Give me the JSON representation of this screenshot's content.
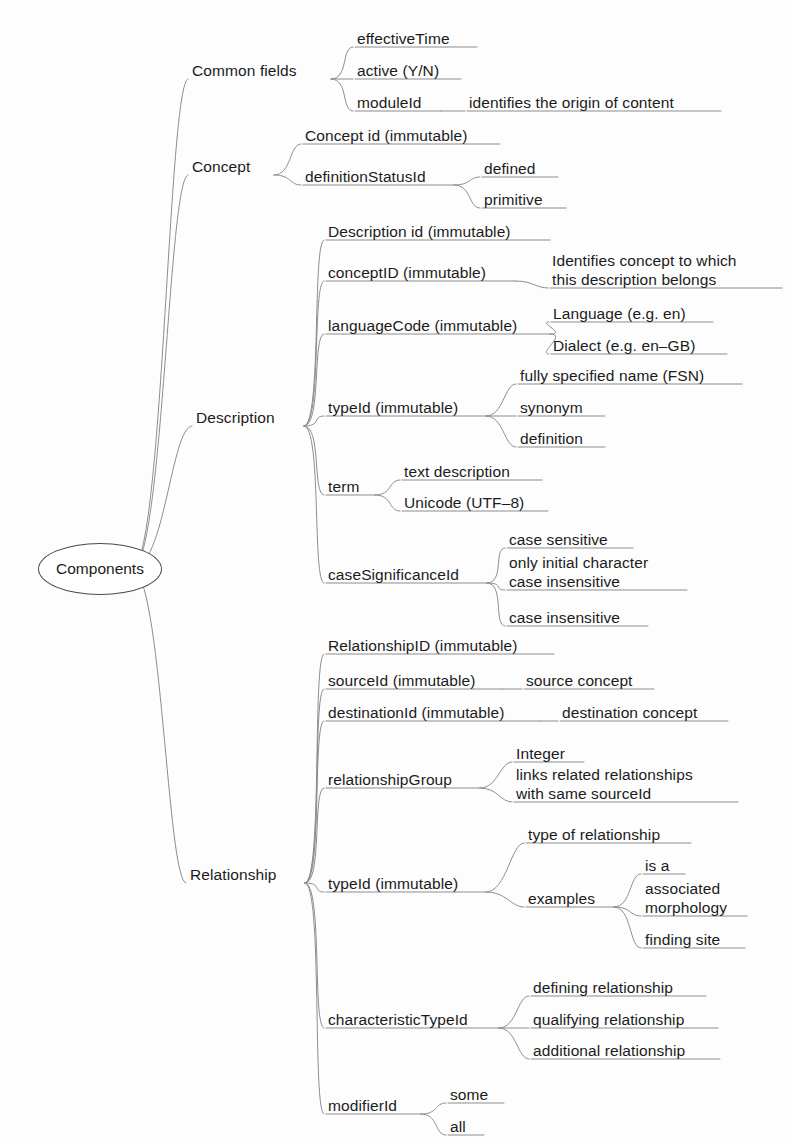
{
  "diagram": {
    "title": "Components",
    "type": "mind-map",
    "root": {
      "label": "Components",
      "x": 38,
      "y": 543,
      "w": 124,
      "h": 52
    },
    "line_color": "#8d8d8d",
    "text_color": "#1b1b1b",
    "background": "#fdfdfd",
    "nodes": [
      {
        "id": "common-fields",
        "label": "Common fields",
        "level": 1,
        "x": 192,
        "y": 61,
        "w": 131,
        "underline": false
      },
      {
        "id": "effective-time",
        "label": "effectiveTime",
        "level": 2,
        "x": 357,
        "y": 29,
        "w": 112,
        "underline": true
      },
      {
        "id": "active-yn",
        "label": "active (Y/N)",
        "level": 2,
        "x": 357,
        "y": 61,
        "w": 96,
        "underline": true
      },
      {
        "id": "module-id",
        "label": "moduleId",
        "level": 2,
        "x": 357,
        "y": 93,
        "w": 76,
        "underline": true
      },
      {
        "id": "identifies-origin",
        "label": "identifies the origin of content",
        "level": 3,
        "x": 469,
        "y": 93,
        "w": 244,
        "underline": true
      },
      {
        "id": "concept",
        "label": "Concept",
        "level": 1,
        "x": 192,
        "y": 157,
        "w": 74,
        "underline": false
      },
      {
        "id": "concept-id",
        "label": "Concept id (immutable)",
        "level": 2,
        "x": 305,
        "y": 126,
        "w": 187,
        "underline": true
      },
      {
        "id": "definition-status-id",
        "label": "definitionStatusId",
        "level": 2,
        "x": 305,
        "y": 167,
        "w": 141,
        "underline": true
      },
      {
        "id": "defined",
        "label": "defined",
        "level": 3,
        "x": 484,
        "y": 159,
        "w": 66,
        "underline": true
      },
      {
        "id": "primitive",
        "label": "primitive",
        "level": 3,
        "x": 484,
        "y": 190,
        "w": 74,
        "underline": true
      },
      {
        "id": "description",
        "label": "Description",
        "level": 1,
        "x": 196,
        "y": 408,
        "w": 100,
        "underline": false
      },
      {
        "id": "description-id",
        "label": "Description id (immutable)",
        "level": 2,
        "x": 328,
        "y": 222,
        "w": 214,
        "underline": true
      },
      {
        "id": "concept-id-2",
        "label": "conceptID (immutable)",
        "level": 2,
        "x": 328,
        "y": 263,
        "w": 179,
        "underline": true
      },
      {
        "id": "identifies-concept",
        "label": "Identifies concept to which\nthis description belongs",
        "level": 3,
        "x": 552,
        "y": 251,
        "w": 222,
        "underline": true
      },
      {
        "id": "language-code",
        "label": "languageCode (immutable)",
        "level": 2,
        "x": 328,
        "y": 316,
        "w": 214,
        "underline": true
      },
      {
        "id": "language-en",
        "label": "Language (e.g. en)",
        "level": 3,
        "x": 553,
        "y": 304,
        "w": 152,
        "underline": true
      },
      {
        "id": "dialect-engb",
        "label": "Dialect (e.g. en–GB)",
        "level": 3,
        "x": 553,
        "y": 336,
        "w": 166,
        "underline": true
      },
      {
        "id": "type-id",
        "label": "typeId (immutable)",
        "level": 2,
        "x": 328,
        "y": 398,
        "w": 150,
        "underline": true
      },
      {
        "id": "fsn",
        "label": "fully specified name (FSN)",
        "level": 3,
        "x": 520,
        "y": 366,
        "w": 214,
        "underline": true
      },
      {
        "id": "synonym",
        "label": "synonym",
        "level": 3,
        "x": 520,
        "y": 398,
        "w": 77,
        "underline": true
      },
      {
        "id": "definition",
        "label": "definition",
        "level": 3,
        "x": 520,
        "y": 429,
        "w": 77,
        "underline": true
      },
      {
        "id": "term",
        "label": "term",
        "level": 2,
        "x": 328,
        "y": 477,
        "w": 39,
        "underline": true
      },
      {
        "id": "text-description",
        "label": "text description",
        "level": 3,
        "x": 404,
        "y": 462,
        "w": 130,
        "underline": true
      },
      {
        "id": "unicode-utf8",
        "label": "Unicode (UTF–8)",
        "level": 3,
        "x": 404,
        "y": 493,
        "w": 136,
        "underline": true
      },
      {
        "id": "case-significance-id",
        "label": "caseSignificanceId",
        "level": 2,
        "x": 328,
        "y": 565,
        "w": 151,
        "underline": true
      },
      {
        "id": "case-sensitive",
        "label": "case sensitive",
        "level": 3,
        "x": 509,
        "y": 530,
        "w": 116,
        "underline": true
      },
      {
        "id": "only-initial-character",
        "label": "only initial character\ncase insensitive",
        "level": 3,
        "x": 509,
        "y": 553,
        "w": 170,
        "underline": true
      },
      {
        "id": "case-insensitive",
        "label": "case insensitive",
        "level": 3,
        "x": 509,
        "y": 608,
        "w": 131,
        "underline": true
      },
      {
        "id": "relationship",
        "label": "Relationship",
        "level": 1,
        "x": 190,
        "y": 865,
        "w": 107,
        "underline": false
      },
      {
        "id": "relationship-id",
        "label": "RelationshipID (immutable)",
        "level": 2,
        "x": 328,
        "y": 636,
        "w": 218,
        "underline": true
      },
      {
        "id": "source-id",
        "label": "sourceId (immutable)",
        "level": 2,
        "x": 328,
        "y": 671,
        "w": 166,
        "underline": true
      },
      {
        "id": "source-concept",
        "label": "source concept",
        "level": 3,
        "x": 526,
        "y": 671,
        "w": 120,
        "underline": true
      },
      {
        "id": "destination-id",
        "label": "destinationId (immutable)",
        "level": 2,
        "x": 328,
        "y": 703,
        "w": 203,
        "underline": true
      },
      {
        "id": "destination-concept",
        "label": "destination concept",
        "level": 3,
        "x": 562,
        "y": 703,
        "w": 158,
        "underline": true
      },
      {
        "id": "relationship-group",
        "label": "relationshipGroup",
        "level": 2,
        "x": 328,
        "y": 770,
        "w": 144,
        "underline": true
      },
      {
        "id": "integer",
        "label": "Integer",
        "level": 3,
        "x": 516,
        "y": 744,
        "w": 60,
        "underline": true
      },
      {
        "id": "links-related",
        "label": "links related relationships\nwith same sourceId",
        "level": 3,
        "x": 516,
        "y": 765,
        "w": 214,
        "underline": true
      },
      {
        "id": "type-id-2",
        "label": "typeId (immutable)",
        "level": 2,
        "x": 328,
        "y": 874,
        "w": 150,
        "underline": true
      },
      {
        "id": "type-of-relationship",
        "label": "type of relationship",
        "level": 3,
        "x": 528,
        "y": 825,
        "w": 155,
        "underline": true
      },
      {
        "id": "examples",
        "label": "examples",
        "level": 3,
        "x": 528,
        "y": 889,
        "w": 78,
        "underline": true
      },
      {
        "id": "is-a",
        "label": "is a",
        "level": 4,
        "x": 645,
        "y": 856,
        "w": 32,
        "underline": true
      },
      {
        "id": "associated-morphology",
        "label": "associated\nmorphology",
        "level": 4,
        "x": 645,
        "y": 879,
        "w": 94,
        "underline": true
      },
      {
        "id": "finding-site",
        "label": "finding site",
        "level": 4,
        "x": 645,
        "y": 930,
        "w": 92,
        "underline": true
      },
      {
        "id": "characteristic-type-id",
        "label": "characteristicTypeId",
        "level": 2,
        "x": 328,
        "y": 1010,
        "w": 163,
        "underline": true
      },
      {
        "id": "defining-relationship",
        "label": "defining relationship",
        "level": 3,
        "x": 533,
        "y": 978,
        "w": 165,
        "underline": true
      },
      {
        "id": "qualifying-relationship",
        "label": "qualifying relationship",
        "level": 3,
        "x": 533,
        "y": 1010,
        "w": 177,
        "underline": true
      },
      {
        "id": "additional-relationship",
        "label": "additional relationship",
        "level": 3,
        "x": 533,
        "y": 1041,
        "w": 179,
        "underline": true
      },
      {
        "id": "modifier-id",
        "label": "modifierId",
        "level": 2,
        "x": 328,
        "y": 1096,
        "w": 85,
        "underline": true
      },
      {
        "id": "some",
        "label": "some",
        "level": 3,
        "x": 450,
        "y": 1085,
        "w": 46,
        "underline": true
      },
      {
        "id": "all",
        "label": "all",
        "level": 3,
        "x": 450,
        "y": 1117,
        "w": 26,
        "underline": true
      }
    ],
    "edges": [
      {
        "from": "root",
        "to": "common-fields"
      },
      {
        "from": "root",
        "to": "concept"
      },
      {
        "from": "root",
        "to": "description"
      },
      {
        "from": "root",
        "to": "relationship"
      },
      {
        "from": "common-fields",
        "to": "effective-time"
      },
      {
        "from": "common-fields",
        "to": "active-yn"
      },
      {
        "from": "common-fields",
        "to": "module-id"
      },
      {
        "from": "module-id",
        "to": "identifies-origin"
      },
      {
        "from": "concept",
        "to": "concept-id"
      },
      {
        "from": "concept",
        "to": "definition-status-id"
      },
      {
        "from": "definition-status-id",
        "to": "defined"
      },
      {
        "from": "definition-status-id",
        "to": "primitive"
      },
      {
        "from": "description",
        "to": "description-id"
      },
      {
        "from": "description",
        "to": "concept-id-2"
      },
      {
        "from": "concept-id-2",
        "to": "identifies-concept"
      },
      {
        "from": "description",
        "to": "language-code"
      },
      {
        "from": "language-code",
        "to": "language-en"
      },
      {
        "from": "language-code",
        "to": "dialect-engb"
      },
      {
        "from": "description",
        "to": "type-id"
      },
      {
        "from": "type-id",
        "to": "fsn"
      },
      {
        "from": "type-id",
        "to": "synonym"
      },
      {
        "from": "type-id",
        "to": "definition"
      },
      {
        "from": "description",
        "to": "term"
      },
      {
        "from": "term",
        "to": "text-description"
      },
      {
        "from": "term",
        "to": "unicode-utf8"
      },
      {
        "from": "description",
        "to": "case-significance-id"
      },
      {
        "from": "case-significance-id",
        "to": "case-sensitive"
      },
      {
        "from": "case-significance-id",
        "to": "only-initial-character"
      },
      {
        "from": "case-significance-id",
        "to": "case-insensitive"
      },
      {
        "from": "relationship",
        "to": "relationship-id"
      },
      {
        "from": "relationship",
        "to": "source-id"
      },
      {
        "from": "source-id",
        "to": "source-concept"
      },
      {
        "from": "relationship",
        "to": "destination-id"
      },
      {
        "from": "destination-id",
        "to": "destination-concept"
      },
      {
        "from": "relationship",
        "to": "relationship-group"
      },
      {
        "from": "relationship-group",
        "to": "integer"
      },
      {
        "from": "relationship-group",
        "to": "links-related"
      },
      {
        "from": "relationship",
        "to": "type-id-2"
      },
      {
        "from": "type-id-2",
        "to": "type-of-relationship"
      },
      {
        "from": "type-id-2",
        "to": "examples"
      },
      {
        "from": "examples",
        "to": "is-a"
      },
      {
        "from": "examples",
        "to": "associated-morphology"
      },
      {
        "from": "examples",
        "to": "finding-site"
      },
      {
        "from": "relationship",
        "to": "characteristic-type-id"
      },
      {
        "from": "characteristic-type-id",
        "to": "defining-relationship"
      },
      {
        "from": "characteristic-type-id",
        "to": "qualifying-relationship"
      },
      {
        "from": "characteristic-type-id",
        "to": "additional-relationship"
      },
      {
        "from": "relationship",
        "to": "modifier-id"
      },
      {
        "from": "modifier-id",
        "to": "some"
      },
      {
        "from": "modifier-id",
        "to": "all"
      }
    ]
  }
}
